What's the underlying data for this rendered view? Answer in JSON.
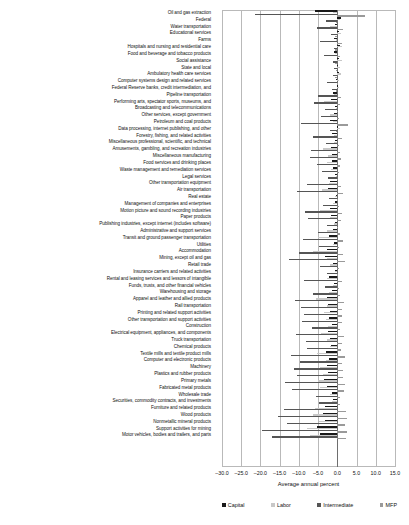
{
  "chart_data": {
    "type": "bar",
    "orientation": "horizontal",
    "title": "",
    "xlabel": "Average annual percent",
    "ylabel": "",
    "xlim": [
      -30.0,
      15.0
    ],
    "xticks": [
      -30.0,
      -25.0,
      -20.0,
      -15.0,
      -10.0,
      -5.0,
      0.0,
      5.0,
      10.0,
      15.0
    ],
    "xticklabels": [
      "-30.0",
      "-25.0",
      "-20.0",
      "-15.0",
      "-10.0",
      "-5.0",
      "0.0",
      "5.0",
      "10.0",
      "15.0"
    ],
    "grid": true,
    "legend_position": "bottom",
    "series": [
      {
        "name": "Capital",
        "color": "#1a1a1a"
      },
      {
        "name": "Labor",
        "color": "#c8c8c8"
      },
      {
        "name": "Intermediate",
        "color": "#555555"
      },
      {
        "name": "MFP",
        "color": "#9a9a9a"
      }
    ],
    "categories": [
      "Oil and gas extraction",
      "Federal",
      "Water transportation",
      "Educational services",
      "Farms",
      "Hospitals and nursing and residential care",
      "Food and beverage and tobacco products",
      "Social assistance",
      "State and local",
      "Ambulatory health care services",
      "Computer systems design and related services",
      "Federal Reserve banks, credit intermediation, and",
      "Pipeline transportation",
      "Performing arts, spectator sports, museums, and",
      "Broadcasting and telecommunications",
      "Other services, except government",
      "Petroleum and coal products",
      "Data processing, internet publishing, and other",
      "Forestry, fishing, and related activities",
      "Miscellaneous professional, scientific, and technical",
      "Amusements, gambling, and recreation industries",
      "Miscellaneous manufacturing",
      "Food services and drinking places",
      "Waste management and remediation services",
      "Legal services",
      "Other transportation equipment",
      "Air transportation",
      "Real estate",
      "Management of companies and enterprises",
      "Motion picture and sound recording industries",
      "Paper products",
      "Publishing industries, except internet (includes software)",
      "Administrative and support services",
      "Transit and ground passenger transportation",
      "Utilities",
      "Accommodation",
      "Mining, except oil and gas",
      "Retail trade",
      "Insurance carriers and related activities",
      "Rental and leasing services and lessors of intangible",
      "Funds, trusts, and other financial vehicles",
      "Warehousing and storage",
      "Apparel and leather and allied products",
      "Rail transportation",
      "Printing and related support activities",
      "Other transportation and support activities",
      "Construction",
      "Electrical equipment, appliances, and components",
      "Truck transportation",
      "Chemical products",
      "Textile mills and textile product mills",
      "Computer and electronic products",
      "Machinery",
      "Plastics and rubber products",
      "Primary metals",
      "Fabricated metal products",
      "Wholesale trade",
      "Securities, commodity contracts, and investments",
      "Furniture and related products",
      "Wood products",
      "Nonmetallic mineral products",
      "Support activities for mining",
      "Motor vehicles, bodies and trailers, and parts"
    ],
    "values": {
      "Capital": [
        -5.8,
        1.0,
        -0.6,
        0.5,
        -0.8,
        0.6,
        -0.9,
        0.4,
        0.2,
        0.5,
        -0.4,
        0.3,
        -1.2,
        -1.6,
        -0.5,
        -0.9,
        -1.8,
        0.2,
        -1.4,
        -0.6,
        -1.7,
        -1.5,
        -1.3,
        -1.0,
        -0.5,
        -1.9,
        -2.4,
        -0.3,
        -0.7,
        -2.0,
        -1.6,
        -0.5,
        -1.1,
        -2.2,
        -0.9,
        -2.6,
        -3.2,
        -1.0,
        -0.6,
        -2.1,
        -0.8,
        -1.5,
        -2.8,
        -2.3,
        -2.0,
        -2.2,
        -1.4,
        -2.5,
        -1.9,
        -1.7,
        -3.0,
        -2.2,
        -2.6,
        -2.4,
        -3.4,
        -2.7,
        -1.3,
        -1.1,
        -3.3,
        -3.6,
        -3.1,
        -5.4,
        -4.6
      ],
      "Labor": [
        -1.2,
        0.8,
        -2.0,
        0.9,
        -0.4,
        1.2,
        -0.6,
        1.1,
        0.7,
        1.0,
        0.4,
        0.5,
        -0.8,
        -3.5,
        -0.3,
        -1.8,
        -1.0,
        0.6,
        -0.9,
        -0.8,
        -3.8,
        -2.4,
        -2.6,
        -1.6,
        -0.4,
        -2.2,
        -4.0,
        -0.5,
        -1.2,
        -4.4,
        -1.8,
        -0.9,
        -2.8,
        -5.0,
        -1.0,
        -6.2,
        -2.8,
        -2.0,
        -0.7,
        -2.6,
        -1.0,
        -2.2,
        -5.6,
        -2.8,
        -3.4,
        -3.0,
        -2.4,
        -4.2,
        -2.6,
        -2.0,
        -5.2,
        -3.0,
        -4.4,
        -3.8,
        -5.0,
        -4.6,
        -1.8,
        -1.4,
        -5.8,
        -6.4,
        -4.8,
        -8.0,
        -7.2
      ],
      "Intermediate": [
        -21.5,
        -3.0,
        -5.2,
        -1.6,
        -4.6,
        -0.8,
        -3.4,
        -1.0,
        -0.9,
        -1.2,
        -2.8,
        -1.4,
        -5.0,
        -6.0,
        -3.2,
        -4.2,
        -9.5,
        -2.0,
        -6.4,
        -3.0,
        -6.8,
        -7.2,
        -5.4,
        -4.0,
        -2.4,
        -8.0,
        -10.5,
        -2.2,
        -3.6,
        -8.4,
        -7.6,
        -2.8,
        -5.0,
        -9.0,
        -4.8,
        -10.0,
        -12.5,
        -4.4,
        -2.6,
        -8.8,
        -3.2,
        -6.2,
        -11.0,
        -9.4,
        -8.6,
        -9.2,
        -6.6,
        -10.8,
        -8.2,
        -7.8,
        -12.0,
        -9.6,
        -11.4,
        -10.6,
        -13.5,
        -11.8,
        -5.6,
        -4.8,
        -14.0,
        -15.5,
        -13.0,
        -19.5,
        -17.0
      ],
      "MFP": [
        7.2,
        -0.4,
        1.4,
        -0.5,
        1.2,
        -0.6,
        0.8,
        -0.5,
        -0.3,
        -0.6,
        0.2,
        -0.4,
        1.0,
        0.6,
        0.3,
        0.5,
        2.8,
        -0.3,
        1.1,
        0.4,
        0.8,
        0.9,
        0.6,
        0.5,
        0.2,
        1.0,
        1.6,
        0.3,
        0.4,
        1.2,
        0.9,
        0.3,
        0.6,
        1.4,
        0.5,
        1.5,
        2.0,
        0.5,
        0.3,
        1.1,
        0.4,
        0.8,
        1.8,
        1.3,
        1.2,
        1.3,
        0.8,
        1.7,
        1.1,
        1.0,
        1.9,
        1.2,
        1.6,
        1.4,
        2.1,
        1.8,
        0.7,
        0.6,
        2.2,
        2.4,
        2.0,
        2.6,
        2.3
      ]
    }
  },
  "legend": {
    "items": [
      {
        "label": "Capital"
      },
      {
        "label": "Labor"
      },
      {
        "label": "Intermediate"
      },
      {
        "label": "MFP"
      }
    ]
  }
}
